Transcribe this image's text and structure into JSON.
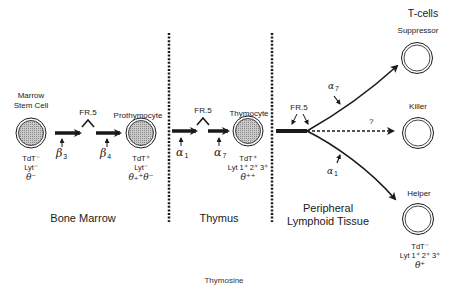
{
  "diagram": {
    "title": "T-cells",
    "caption": "Thymosine",
    "regions": [
      {
        "label": "Bone Marrow"
      },
      {
        "label": "Thymus"
      },
      {
        "label_line1": "Peripheral",
        "label_line2": "Lymphoid Tissue"
      }
    ],
    "cells": {
      "stem": {
        "name_line1": "Marrow",
        "name_line2": "Stem Cell",
        "markers": [
          "TdT⁻",
          "Lyt⁻",
          "θ⁻"
        ]
      },
      "prothymocyte": {
        "name": "Prothymocyte",
        "markers": [
          "TdT⁺",
          "Lyt⁻",
          "θ₊⁺θ⁻"
        ]
      },
      "thymocyte": {
        "name": "Thymocyte",
        "markers": [
          "TdT⁺",
          "Lyt 1⁺ 2⁺ 3⁺",
          "θ⁺⁺"
        ]
      },
      "suppressor": {
        "name": "Suppressor"
      },
      "killer": {
        "name": "Killer"
      },
      "helper": {
        "name": "Helper",
        "markers": [
          "TdT⁻",
          "Lyt 1⁺ 2⁺ 3⁺",
          "θ⁺"
        ]
      }
    },
    "factors": {
      "fr5_a": "FR.5",
      "fr5_b": "FR.5",
      "fr5_c": "FR.5",
      "beta3": {
        "sym": "β",
        "sub": "3"
      },
      "beta4": {
        "sym": "β",
        "sub": "4"
      },
      "alpha1_thymus": {
        "sym": "α",
        "sub": "1"
      },
      "alpha7_thymus": {
        "sym": "α",
        "sub": "7"
      },
      "alpha7_periph": {
        "sym": "α",
        "sub": "7"
      },
      "alpha1_periph": {
        "sym": "α",
        "sub": "1"
      },
      "unknown": "?"
    }
  }
}
